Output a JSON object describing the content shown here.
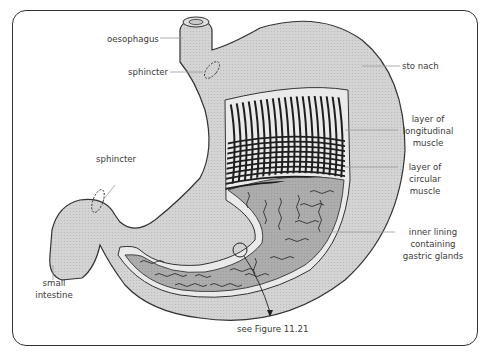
{
  "figure": {
    "colors": {
      "outer_wall": "#d2d2d2",
      "inner_lining": "#a9a9a9",
      "muscle_stripes": "#1e1e1e",
      "outline": "#333333",
      "leader_lines": "#9a9a9a"
    },
    "labels": {
      "oesophagus": "oesophagus",
      "sphincter_top": "sphincter",
      "stomach": "sto nach",
      "longitudinal_1": "layer of",
      "longitudinal_2": "longitudinal",
      "longitudinal_3": "muscle",
      "circular_1": "layer of",
      "circular_2": "circular",
      "circular_3": "muscle",
      "sphincter_bottom": "sphincter",
      "inner_1": "inner lining",
      "inner_2": "containing",
      "inner_3": "gastric glands",
      "small_intestine_1": "small",
      "small_intestine_2": "intestine",
      "see_figure": "see Figure 11.21"
    }
  }
}
